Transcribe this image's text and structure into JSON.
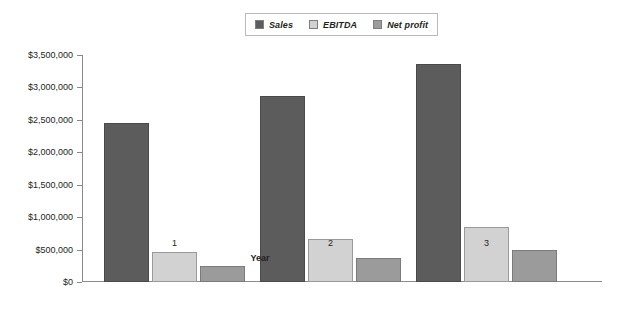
{
  "chart_data": {
    "type": "bar",
    "title": "",
    "xlabel": "Year",
    "ylabel": "",
    "categories": [
      "1",
      "2",
      "3"
    ],
    "series": [
      {
        "name": "Sales",
        "values": [
          2450000,
          2870000,
          3360000
        ],
        "color": "#5c5c5c"
      },
      {
        "name": "EBITDA",
        "values": [
          470000,
          660000,
          850000
        ],
        "color": "#d2d2d2"
      },
      {
        "name": "Net profit",
        "values": [
          250000,
          370000,
          490000
        ],
        "color": "#9b9b9b"
      }
    ],
    "ylim": [
      0,
      3500000
    ],
    "ytick_values": [
      0,
      500000,
      1000000,
      1500000,
      2000000,
      2500000,
      3000000,
      3500000
    ],
    "ytick_labels": [
      "$0",
      "$500,000",
      "$1,000,000",
      "$1,500,000",
      "$2,000,000",
      "$2,500,000",
      "$3,000,000",
      "$3,500,000"
    ],
    "grid": false,
    "legend_position": "top-center"
  },
  "legend": {
    "entries": [
      {
        "label": "Sales"
      },
      {
        "label": "EBITDA"
      },
      {
        "label": "Net profit"
      }
    ]
  },
  "axes": {
    "x_title": "Year",
    "x_tick_labels": [
      "1",
      "2",
      "3"
    ]
  }
}
